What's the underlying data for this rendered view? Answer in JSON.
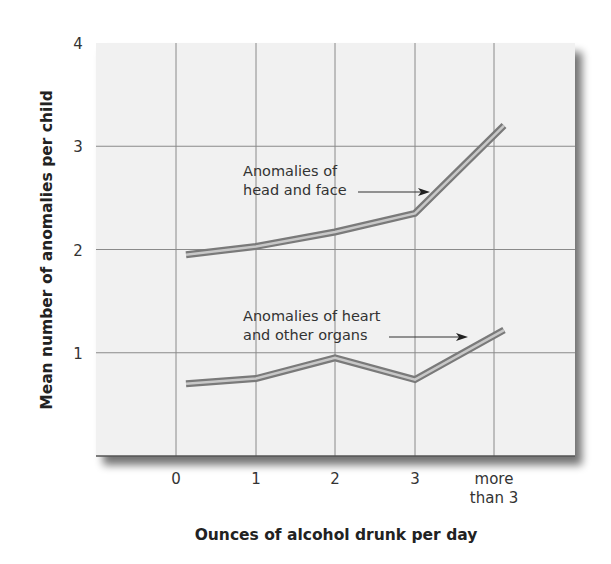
{
  "chart_data": {
    "type": "line",
    "title": "",
    "xlabel": "Ounces of alcohol drunk per day",
    "ylabel": "Mean number of anomalies per child",
    "categories": [
      "0",
      "1",
      "2",
      "3",
      "more than 3"
    ],
    "x_tick_labels": [
      [
        "0"
      ],
      [
        "1"
      ],
      [
        "2"
      ],
      [
        "3"
      ],
      [
        "more",
        "than 3"
      ]
    ],
    "y_ticks": [
      1,
      2,
      3,
      4
    ],
    "ylim": [
      0,
      4
    ],
    "grid": true,
    "legend": "none (inline annotations with arrows)",
    "series": [
      {
        "name": "Anomalies of head and face",
        "label_lines": [
          "Anomalies of",
          "head and face"
        ],
        "values": [
          1.95,
          2.03,
          2.17,
          2.35,
          3.2
        ]
      },
      {
        "name": "Anomalies of heart and other organs",
        "label_lines": [
          "Anomalies of heart",
          "and other organs"
        ],
        "values": [
          0.7,
          0.75,
          0.95,
          0.74,
          1.22
        ]
      }
    ]
  },
  "colors": {
    "plot_bg": "#f1f1f1",
    "grid": "#8a8a8a",
    "line_outer": "#7a7a7a",
    "line_inner": "#c8c8c8",
    "text": "#333333"
  }
}
